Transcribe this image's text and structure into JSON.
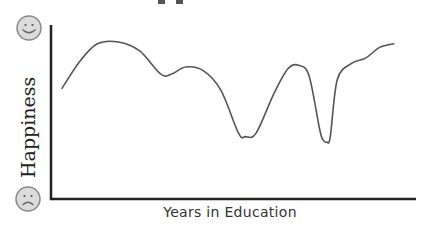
{
  "chart_data": {
    "type": "line",
    "title": "",
    "xlabel": "Years in Education",
    "ylabel": "Happiness",
    "y_axis_top_icon": "happy-face-icon",
    "y_axis_bottom_icon": "sad-face-icon",
    "grid": false,
    "legend": null,
    "note": "Qualitative sketch; no numeric ticks. Values normalized 0 (sad) to 100 (happy), x normalized 0-100.",
    "x": [
      0,
      5,
      10,
      16,
      22,
      28,
      31,
      35,
      40,
      45,
      50,
      52,
      55,
      60,
      64,
      67,
      70,
      73,
      74,
      75,
      76,
      78,
      82,
      86,
      90,
      94
    ],
    "values": [
      63,
      78,
      88,
      89,
      84,
      71,
      71,
      75,
      73,
      62,
      38,
      36,
      38,
      60,
      74,
      76,
      70,
      40,
      34,
      33,
      36,
      68,
      77,
      80,
      86,
      88
    ],
    "series": [
      {
        "name": "Happiness",
        "color": "#555555"
      }
    ]
  },
  "colors": {
    "axis": "#222222",
    "line": "#555555",
    "face_fill": "#dddddd",
    "face_stroke": "#888888"
  }
}
